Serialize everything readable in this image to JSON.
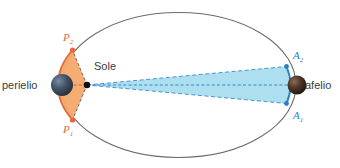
{
  "figure": {
    "labels": {
      "perihelion": "perielio",
      "aphelion": "afelio",
      "sun": "Sole",
      "area_p2": "P",
      "area_p2_sub": "2",
      "area_p1": "P",
      "area_p1_sub": "1",
      "area_a2": "A",
      "area_a2_sub": "2",
      "area_a1": "A",
      "area_a1_sub": "1"
    },
    "colors": {
      "orbit_stroke": "#6b6b6b",
      "perihelion_sector_fill": "#f4a96a",
      "perihelion_sector_stroke": "#3a3a3a",
      "aphelion_sector_fill": "#9fd9ef",
      "aphelion_sector_stroke": "#2a7fc4",
      "perihelion_marker": "#e8663c",
      "aphelion_marker": "#2a7fc4",
      "sun_dot": "#111111",
      "planet_perihelion": "#3d4a5c",
      "planet_aphelion": "#4a3326",
      "text": "#3b3b3b",
      "label_p": "#e8663c",
      "label_a": "#2a7fc4",
      "background": "#ffffff"
    },
    "geometry": {
      "ellipse_center_x": 178.5,
      "ellipse_center_y": 85,
      "semi_major": 117.5,
      "semi_minor": 72.5,
      "sun_focus_x": 87,
      "sun_focus_y": 85,
      "perihelion_x": 61,
      "aphelion_x": 296
    }
  }
}
